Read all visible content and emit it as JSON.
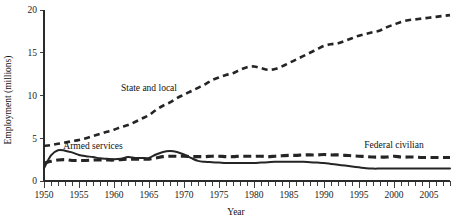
{
  "chart_data": {
    "type": "line",
    "title": "",
    "xlabel": "Year",
    "ylabel": "Employment (millions)",
    "xlim": [
      1950,
      2008
    ],
    "ylim": [
      0,
      20
    ],
    "grid": false,
    "legend_position": "inline-annotations",
    "x_ticks_major": [
      1950,
      1955,
      1960,
      1965,
      1970,
      1975,
      1980,
      1985,
      1990,
      1995,
      2000,
      2005
    ],
    "x_tick_labels": [
      "1950",
      "1955",
      "1960",
      "1965",
      "1970",
      "1975",
      "1980",
      "1985",
      "1990",
      "1995",
      "2000",
      "2005"
    ],
    "x_tick_interval_minor": 1,
    "y_ticks": [
      0,
      5,
      10,
      15,
      20
    ],
    "y_tick_labels": [
      "0",
      "5",
      "10",
      "15",
      "20"
    ],
    "x": [
      1950,
      1951,
      1952,
      1953,
      1954,
      1955,
      1956,
      1957,
      1958,
      1959,
      1960,
      1961,
      1962,
      1963,
      1964,
      1965,
      1966,
      1967,
      1968,
      1969,
      1970,
      1971,
      1972,
      1973,
      1974,
      1975,
      1976,
      1977,
      1978,
      1979,
      1980,
      1981,
      1982,
      1983,
      1984,
      1985,
      1986,
      1987,
      1988,
      1989,
      1990,
      1991,
      1992,
      1993,
      1994,
      1995,
      1996,
      1997,
      1998,
      1999,
      2000,
      2001,
      2002,
      2003,
      2004,
      2005,
      2006,
      2007,
      2008
    ],
    "series": [
      {
        "name": "State and local",
        "style": "dashed-thin",
        "color": "#252525",
        "values": [
          4.1,
          4.2,
          4.35,
          4.5,
          4.65,
          4.8,
          5.0,
          5.25,
          5.5,
          5.75,
          6.0,
          6.3,
          6.55,
          6.9,
          7.3,
          7.7,
          8.3,
          8.8,
          9.2,
          9.7,
          10.1,
          10.5,
          10.9,
          11.3,
          11.8,
          12.1,
          12.4,
          12.6,
          13.0,
          13.3,
          13.4,
          13.2,
          13.0,
          13.1,
          13.4,
          13.8,
          14.2,
          14.6,
          15.0,
          15.4,
          15.8,
          16.0,
          16.1,
          16.4,
          16.7,
          17.0,
          17.2,
          17.4,
          17.6,
          18.0,
          18.3,
          18.6,
          18.8,
          18.9,
          19.0,
          19.1,
          19.2,
          19.3,
          19.4
        ],
        "annotation": "State and local"
      },
      {
        "name": "Armed services",
        "style": "solid",
        "color": "#252525",
        "values": [
          1.5,
          3.0,
          3.6,
          3.55,
          3.35,
          3.05,
          2.9,
          2.8,
          2.65,
          2.6,
          2.55,
          2.6,
          2.8,
          2.7,
          2.7,
          2.7,
          3.1,
          3.4,
          3.5,
          3.4,
          3.1,
          2.7,
          2.35,
          2.25,
          2.2,
          2.15,
          2.1,
          2.1,
          2.1,
          2.1,
          2.1,
          2.15,
          2.2,
          2.25,
          2.25,
          2.25,
          2.25,
          2.25,
          2.2,
          2.15,
          2.1,
          2.0,
          1.9,
          1.8,
          1.7,
          1.6,
          1.5,
          1.45,
          1.45,
          1.45,
          1.45,
          1.45,
          1.45,
          1.45,
          1.45,
          1.45,
          1.45,
          1.45,
          1.45
        ],
        "annotation": "Armed services"
      },
      {
        "name": "Federal civilian",
        "style": "dashed-thick",
        "color": "#252525",
        "values": [
          2.1,
          2.3,
          2.45,
          2.5,
          2.4,
          2.4,
          2.4,
          2.45,
          2.45,
          2.45,
          2.45,
          2.5,
          2.55,
          2.55,
          2.55,
          2.55,
          2.7,
          2.85,
          2.9,
          2.9,
          2.9,
          2.85,
          2.85,
          2.85,
          2.9,
          2.9,
          2.85,
          2.85,
          2.9,
          2.9,
          2.9,
          2.9,
          2.85,
          2.9,
          2.95,
          3.0,
          3.0,
          3.05,
          3.05,
          3.05,
          3.1,
          3.05,
          3.05,
          3.0,
          2.95,
          2.9,
          2.85,
          2.8,
          2.8,
          2.8,
          2.9,
          2.8,
          2.8,
          2.8,
          2.75,
          2.75,
          2.75,
          2.75,
          2.75
        ],
        "annotation": "Federal civilian"
      }
    ],
    "annotations": [
      {
        "text": "State and local",
        "x": 1965,
        "y": 10.5
      },
      {
        "text": "Armed services",
        "x": 1957,
        "y": 3.7
      },
      {
        "text": "Federal civilian",
        "x": 2000,
        "y": 3.9
      }
    ]
  }
}
